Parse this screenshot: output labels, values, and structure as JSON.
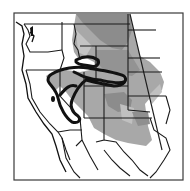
{
  "map": {
    "type": "range-map",
    "region": "Western United States and northern Mexico",
    "colors": {
      "background": "#ffffff",
      "frame": "#3a3a3a",
      "borders": "#1a1a1a",
      "range_dark": "#8c8c8c",
      "range_medium": "#a8a8a8",
      "range_light": "#c4c4c4",
      "outline": "#111111"
    },
    "frame": {
      "x": 14,
      "y": 13,
      "width": 169,
      "height": 167
    },
    "legend": null,
    "labels": []
  }
}
